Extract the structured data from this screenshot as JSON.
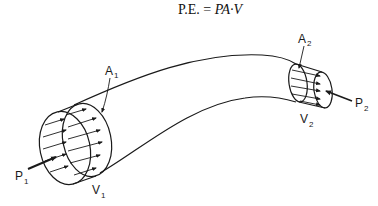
{
  "equation": {
    "lhs": "P.E. =",
    "rhs": "PA·V"
  },
  "labels": {
    "A1": {
      "main": "A",
      "sub": "1"
    },
    "A2": {
      "main": "A",
      "sub": "2"
    },
    "P1": {
      "main": "P",
      "sub": "1"
    },
    "P2": {
      "main": "P",
      "sub": "2"
    },
    "V1": {
      "main": "V",
      "sub": "1"
    },
    "V2": {
      "main": "V",
      "sub": "2"
    }
  },
  "colors": {
    "stroke": "#1a1a1a",
    "background": "#ffffff"
  }
}
